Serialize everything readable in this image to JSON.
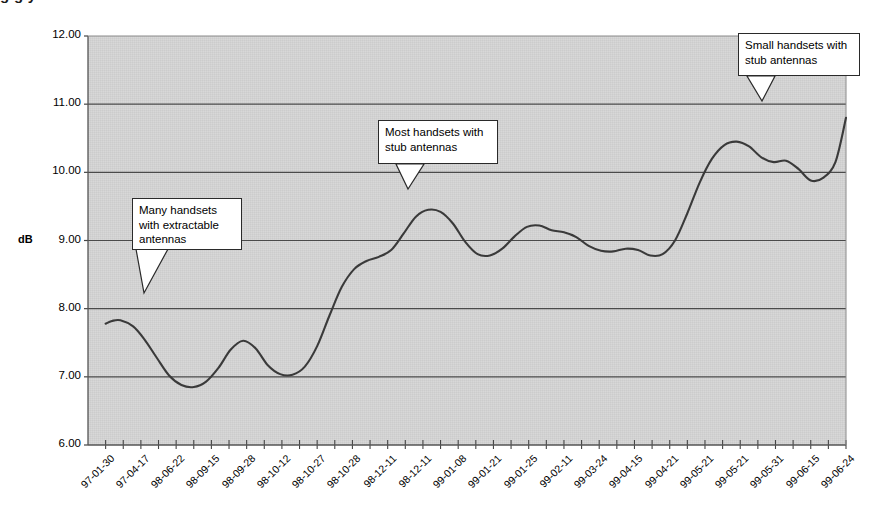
{
  "title_fragment": "g g y",
  "axis": {
    "y_label": "dB",
    "y_ticks": [
      "6.00",
      "7.00",
      "8.00",
      "9.00",
      "10.00",
      "11.00",
      "12.00"
    ],
    "x_ticks": [
      "97-01-30",
      "97-04-17",
      "98-06-22",
      "98-09-15",
      "98-09-28",
      "98-10-12",
      "98-10-27",
      "98-10-28",
      "98-12-11",
      "98-12-11",
      "99-01-08",
      "99-01-21",
      "99-01-25",
      "99-02-11",
      "99-03-24",
      "99-04-15",
      "99-04-21",
      "99-05-21",
      "99-05-21",
      "99-05-31",
      "99-06-15",
      "99-06-24"
    ]
  },
  "annotations": [
    {
      "id": "many-handsets",
      "lines": [
        "Many handsets",
        "with extractable",
        "antennas"
      ]
    },
    {
      "id": "most-handsets",
      "lines": [
        "Most handsets with",
        "stub antennas"
      ]
    },
    {
      "id": "small-handsets",
      "lines": [
        "Small handsets with",
        "stub antennas"
      ]
    }
  ],
  "colors": {
    "plot_background": "#d2d2d2",
    "gridline": "#4a4a4a",
    "series_line": "#3a3a3a",
    "frame": "#555555",
    "callout_fill": "#ffffff",
    "callout_border": "#2a2a2a"
  },
  "chart_data": {
    "type": "line",
    "title": "",
    "xlabel": "",
    "ylabel": "dB",
    "ylim": [
      6.0,
      12.0
    ],
    "ygrid": true,
    "legend": "none",
    "x": [
      "97-01-30",
      "97-04-17",
      "98-06-22",
      "98-09-15",
      "98-09-28",
      "98-10-12",
      "98-10-27",
      "98-10-28",
      "98-12-11",
      "98-12-11",
      "99-01-08",
      "99-01-21",
      "99-01-25",
      "99-02-11",
      "99-03-24",
      "99-04-15",
      "99-04-21",
      "99-05-21",
      "99-05-21",
      "99-05-31",
      "99-06-15",
      "99-06-24"
    ],
    "series": [
      {
        "name": "dB",
        "values": [
          7.78,
          7.83,
          7.4,
          6.86,
          7.03,
          7.53,
          7.06,
          7.03,
          7.55,
          8.3,
          8.68,
          8.78,
          9.22,
          9.45,
          9.05,
          8.75,
          9.1,
          9.22,
          9.1,
          8.95,
          8.88,
          8.8
        ]
      }
    ],
    "dense_points": {
      "note": "Smooth curve sampled at the plotted resolution (x in tick index units, y in dB)",
      "t": [
        0.0,
        0.18,
        0.42,
        0.78,
        1.1,
        1.45,
        1.8,
        2.15,
        2.5,
        2.85,
        3.2,
        3.55,
        3.9,
        4.25,
        4.6,
        4.95,
        5.3,
        5.65,
        6.0,
        6.35,
        6.7,
        7.05,
        7.4,
        7.75,
        8.1,
        8.45,
        8.8,
        9.15,
        9.5,
        9.85,
        10.2,
        10.55,
        10.9,
        11.25,
        11.6,
        11.95,
        12.3,
        12.65,
        13.0,
        13.35,
        13.7,
        14.05,
        14.4,
        14.75,
        15.1,
        15.45,
        15.8,
        16.15,
        16.5,
        16.85,
        17.2,
        17.55,
        17.9,
        18.25,
        18.6,
        18.95,
        19.3,
        19.65,
        20.0,
        20.35,
        20.7,
        21.0
      ],
      "y": [
        7.78,
        7.82,
        7.83,
        7.74,
        7.55,
        7.28,
        7.02,
        6.88,
        6.85,
        6.93,
        7.13,
        7.4,
        7.53,
        7.42,
        7.17,
        7.04,
        7.03,
        7.15,
        7.45,
        7.9,
        8.32,
        8.58,
        8.7,
        8.76,
        8.86,
        9.1,
        9.35,
        9.45,
        9.42,
        9.25,
        8.98,
        8.8,
        8.78,
        8.88,
        9.06,
        9.2,
        9.22,
        9.15,
        9.12,
        9.05,
        8.92,
        8.85,
        8.84,
        8.88,
        8.86,
        8.78,
        8.8,
        9.0,
        9.4,
        9.85,
        10.2,
        10.4,
        10.45,
        10.38,
        10.22,
        10.15,
        10.17,
        10.05,
        9.88,
        9.92,
        10.15,
        10.8
      ]
    }
  }
}
